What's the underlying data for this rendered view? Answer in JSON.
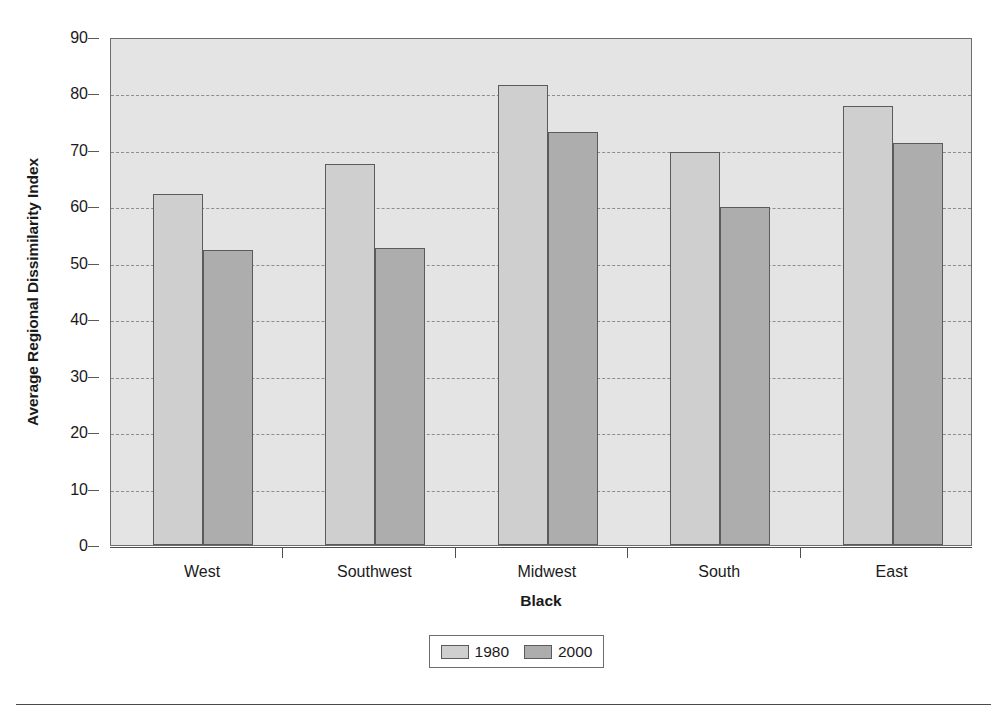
{
  "chart_data": {
    "type": "bar",
    "title": "",
    "xlabel": "Black",
    "ylabel": "Average Regional Dissimilarity Index",
    "categories": [
      "West",
      "Southwest",
      "Midwest",
      "South",
      "East"
    ],
    "series": [
      {
        "name": "1980",
        "color": "#cfcfcf",
        "values": [
          62.2,
          67.5,
          81.5,
          69.7,
          77.7
        ]
      },
      {
        "name": "2000",
        "color": "#adadad",
        "values": [
          52.3,
          52.6,
          73.2,
          59.9,
          71.2
        ]
      }
    ],
    "ylim": [
      0,
      90
    ],
    "ytick_labels": [
      "0",
      "10",
      "20",
      "30",
      "40",
      "50",
      "60",
      "70",
      "80",
      "90"
    ],
    "ytick_values": [
      0,
      10,
      20,
      30,
      40,
      50,
      60,
      70,
      80,
      90
    ],
    "grid": true,
    "grid_axis": "y",
    "grid_style": "dashed",
    "legend_position": "bottom-center",
    "plot_background": "#e4e4e4",
    "frame_color": "#6d6d6d"
  },
  "legend": {
    "entries": [
      {
        "label": "1980",
        "swatch": "legend-swatch-1980"
      },
      {
        "label": "2000",
        "swatch": "legend-swatch-2000"
      }
    ]
  },
  "axes": {
    "y_title": "Average Regional Dissimilarity Index",
    "x_title": "Black"
  }
}
